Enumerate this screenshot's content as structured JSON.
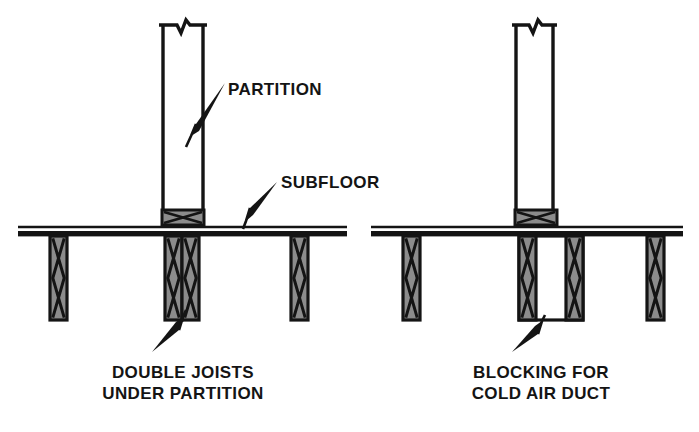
{
  "diagram": {
    "canvas": {
      "width": 699,
      "height": 432,
      "background": "#ffffff"
    },
    "colors": {
      "line": "#141414",
      "member_fill": "#8c8c8c",
      "void_fill": "#ffffff",
      "background": "#ffffff"
    },
    "figures": [
      {
        "id": "left",
        "name": "double-joists-under-partition",
        "caption_lines": [
          "DOUBLE JOISTS",
          "UNDER PARTITION"
        ],
        "callouts": [
          {
            "name": "partition",
            "label": "PARTITION"
          },
          {
            "name": "subfloor",
            "label": "SUBFLOOR"
          }
        ]
      },
      {
        "id": "right",
        "name": "blocking-for-cold-air-duct",
        "caption_lines": [
          "BLOCKING FOR",
          "COLD AIR DUCT"
        ],
        "callouts": []
      }
    ]
  },
  "labels": {
    "partition": "PARTITION",
    "subfloor": "SUBFLOOR",
    "left_caption_1": "DOUBLE JOISTS",
    "left_caption_2": "UNDER PARTITION",
    "right_caption_1": "BLOCKING FOR",
    "right_caption_2": "COLD AIR DUCT"
  }
}
